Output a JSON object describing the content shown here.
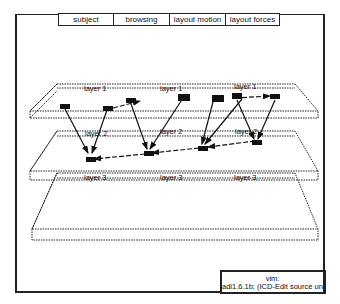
{
  "menu": {
    "items": [
      {
        "label": "subject",
        "width": 56
      },
      {
        "label": "browsing",
        "width": 56
      },
      {
        "label": "layout motion",
        "width": 56
      },
      {
        "label": "layout forces",
        "width": 54
      }
    ]
  },
  "layers": {
    "layer1": {
      "labels": [
        "layer 1",
        "layer 1",
        "layer 1"
      ]
    },
    "layer2": {
      "labels": [
        "layer 2",
        "layer 2",
        "layer 2"
      ]
    },
    "layer3": {
      "labels": [
        "layer 3",
        "layer 3",
        "layer 3"
      ]
    }
  },
  "status": {
    "line1": "vim:",
    "line2": "adi1.6.1b; (ICD-Edit source unde"
  },
  "colors": {
    "ink": "#111111",
    "background": "#ffffff"
  }
}
